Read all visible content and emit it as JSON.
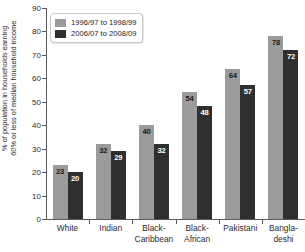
{
  "chart_data": {
    "type": "bar",
    "title": "",
    "xlabel": "",
    "ylabel": "% of population in households earning\n60% or less of median household income",
    "ylim": [
      0,
      90
    ],
    "yticks": [
      0,
      10,
      20,
      30,
      40,
      50,
      60,
      70,
      80,
      90
    ],
    "grid": false,
    "legend_position": "top-left",
    "categories": [
      "White",
      "Indian",
      "Black-\nCaribbean",
      "Black-\nAfrican",
      "Pakistani",
      "Bangla-\ndeshi"
    ],
    "series": [
      {
        "name": "1996/97 to 1998/99",
        "color": "#9b9b9b",
        "values": [
          23,
          32,
          40,
          54,
          64,
          78
        ]
      },
      {
        "name": "2006/07 to 2008/09",
        "color": "#2f2f2f",
        "values": [
          20,
          29,
          32,
          48,
          57,
          72
        ]
      }
    ]
  }
}
